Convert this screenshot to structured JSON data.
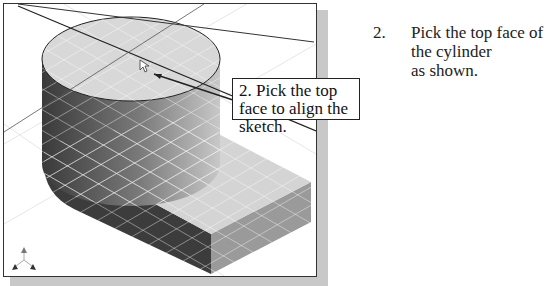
{
  "viewport": {
    "description": "3D isometric model: cylinder on rectangular base with sketch grid",
    "cursor_icon": "arrow-pointer-icon",
    "triad_icon": "xyz-triad-icon"
  },
  "callout": {
    "text": "2. Pick the top face to align the sketch."
  },
  "instruction": {
    "number": "2.",
    "line1": "Pick the top face of the cylinder",
    "line2": "as shown."
  }
}
